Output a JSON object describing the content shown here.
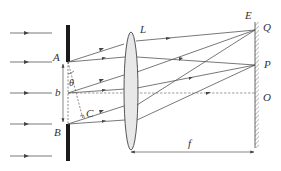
{
  "figure": {
    "labels": {
      "A": "A",
      "B": "B",
      "b": "b",
      "theta": "θ",
      "C": "C",
      "L": "L",
      "E": "E",
      "Q": "Q",
      "P": "P",
      "O": "O",
      "f": "f"
    },
    "elements": {
      "incident_rays": 5,
      "slit_edges": [
        "A",
        "B"
      ],
      "slit_width": "b",
      "diffraction_angle": "θ",
      "perpendicular_foot": "C",
      "lens": "L",
      "screen": "E",
      "screen_points": [
        "Q",
        "P",
        "O"
      ],
      "focal_length": "f"
    },
    "colors": {
      "line": "#555555",
      "slit": "#1a1a1a",
      "lens_fill": "#e8e8e8",
      "dashed": "#777777"
    }
  }
}
